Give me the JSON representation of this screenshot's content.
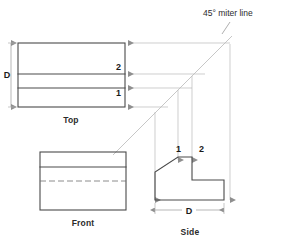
{
  "figure": {
    "title_note": "45° miter line",
    "background_color": "#ffffff",
    "line_color": "#4a4a4a",
    "projection_color": "#b9b9b9"
  },
  "views": {
    "top": {
      "label": "Top",
      "depth_dimension_label": "D",
      "point_labels": {
        "upper": "2",
        "lower": "1"
      }
    },
    "front": {
      "label": "Front"
    },
    "side": {
      "label": "Side",
      "depth_dimension_label": "D",
      "point_labels": {
        "left": "1",
        "right": "2"
      }
    }
  },
  "annotations": {
    "miter_note": "45° miter line"
  }
}
